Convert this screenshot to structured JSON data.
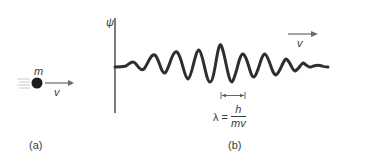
{
  "panel_a": {
    "label": "(a)",
    "mass_label": "m",
    "velocity_label": "v",
    "particle": "ball-with-motion-lines"
  },
  "panel_b": {
    "label": "(b)",
    "axis_label": "ψ",
    "velocity_label": "v",
    "wavelength_formula": {
      "lhs": "λ =",
      "numerator": "h",
      "denominator": "mv"
    },
    "wave": "wave-packet"
  },
  "colors": {
    "ink": "#333333",
    "arrow": "#6a6a6a"
  }
}
